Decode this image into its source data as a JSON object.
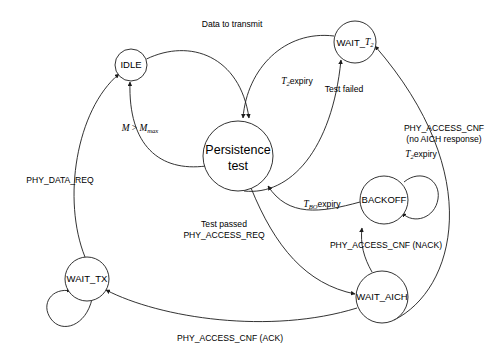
{
  "diagram": {
    "type": "state-diagram",
    "canvas": {
      "width": 501,
      "height": 352
    },
    "colors": {
      "stroke": "#1c1c1c",
      "background": "#ffffff",
      "text": "#000000"
    },
    "states": [
      {
        "id": "idle",
        "label": "IDLE",
        "cx": 131,
        "cy": 65,
        "r": 16
      },
      {
        "id": "persistence-test",
        "label_line1": "Persistence",
        "label_line2": "test",
        "cx": 238,
        "cy": 156,
        "r": 35
      },
      {
        "id": "wait-t2",
        "label_prefix": "WAIT_",
        "label_italic": "T",
        "label_sub": "2",
        "cx": 355,
        "cy": 42,
        "r": 21
      },
      {
        "id": "backoff",
        "label": "BACKOFF",
        "cx": 384,
        "cy": 200,
        "r": 24
      },
      {
        "id": "wait-aich",
        "label": "WAIT_AICH",
        "cx": 382,
        "cy": 297,
        "r": 26
      },
      {
        "id": "wait-tx",
        "label": "WAIT_TX",
        "cx": 87,
        "cy": 279,
        "r": 22
      }
    ],
    "self_loops": [
      {
        "id": "backoff-self-loop",
        "from": "backoff",
        "cx": 414,
        "cy": 192,
        "r": 19
      },
      {
        "id": "wait-tx-self-loop",
        "from": "wait-tx",
        "cx": 73,
        "cy": 309,
        "r": 21
      }
    ],
    "transitions": [
      {
        "id": "idle-to-persistence",
        "from": "idle",
        "to": "persistence-test",
        "label": "Data to transmit"
      },
      {
        "id": "persistence-to-idle",
        "from": "persistence-test",
        "to": "idle",
        "label_math": true,
        "label": "M > Mmax"
      },
      {
        "id": "persistence-to-wait-t2",
        "from": "persistence-test",
        "to": "wait-t2",
        "label": "Test failed"
      },
      {
        "id": "wait-t2-to-persistence",
        "from": "wait-t2",
        "to": "persistence-test",
        "label_math": true,
        "label": "T2expiry"
      },
      {
        "id": "persistence-to-wait-aich",
        "from": "persistence-test",
        "to": "wait-aich",
        "label_line1": "Test passed",
        "label_line2": "PHY_ACCESS_REQ"
      },
      {
        "id": "wait-aich-to-backoff",
        "from": "wait-aich",
        "to": "backoff",
        "label": "PHY_ACCESS_CNF (NACK)"
      },
      {
        "id": "backoff-to-persistence",
        "from": "backoff",
        "to": "persistence-test",
        "label_math": true,
        "label": "TBOexpiry"
      },
      {
        "id": "wait-aich-to-wait-t2",
        "from": "wait-aich",
        "to": "wait-t2",
        "label_line1": "PHY_ACCESS_CNF",
        "label_line2": "(no AICH response)"
      },
      {
        "id": "wait-aich-to-wait-tx",
        "from": "wait-aich",
        "to": "wait-tx",
        "label": "PHY_ACCESS_CNF (ACK)"
      },
      {
        "id": "wait-tx-to-idle",
        "from": "wait-tx",
        "to": "idle",
        "label": "PHY_DATA_REQ"
      },
      {
        "id": "backoff-self",
        "from": "backoff",
        "to": "backoff",
        "label_math": true,
        "label": "T2expiry"
      }
    ],
    "labels": {
      "data_to_transmit": "Data to transmit",
      "test_failed": "Test failed",
      "test_passed": "Test passed",
      "phy_access_req": "PHY_ACCESS_REQ",
      "phy_access_cnf_nack": "PHY_ACCESS_CNF (NACK)",
      "phy_access_cnf": "PHY_ACCESS_CNF",
      "no_aich_response": "(no AICH response)",
      "phy_access_cnf_ack": "PHY_ACCESS_CNF (ACK)",
      "phy_data_req": "PHY_DATA_REQ",
      "expiry": "expiry",
      "m_var": "M",
      "m_gt": " > ",
      "m_max_var": "M",
      "m_max_sub": "max",
      "t_var": "T",
      "t2_sub": "2",
      "tbo_sub": "BO"
    }
  }
}
